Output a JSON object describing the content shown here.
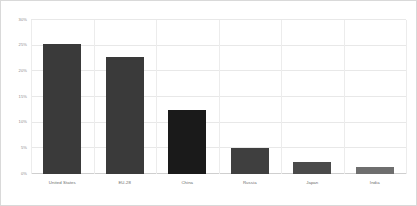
{
  "chart_data": {
    "type": "bar",
    "title": "",
    "subtitle": "",
    "xlabel": "",
    "ylabel": "",
    "categories": [
      "United States",
      "EU-28",
      "China",
      "Russia",
      "Japan",
      "India"
    ],
    "values": [
      25.4,
      22.7,
      12.5,
      5.0,
      2.3,
      1.4
    ],
    "value_suffix": "%",
    "ylim": [
      0,
      30
    ],
    "yticks": [
      0,
      5,
      10,
      15,
      20,
      25,
      30
    ],
    "ytick_labels": [
      "0%",
      "5%",
      "10%",
      "15%",
      "20%",
      "25%",
      "30%"
    ],
    "grid": {
      "horizontal": true,
      "vertical": true
    },
    "legend": {
      "visible": false,
      "position": "none",
      "entries": []
    },
    "bar_colors": [
      "#3a3a3a",
      "#3a3a3a",
      "#1a1a1a",
      "#3f3f3f",
      "#4a4a4a",
      "#6e6e6e"
    ],
    "annotations": []
  },
  "style": {
    "background_color": "#ffffff",
    "border_color": "#d9d9d9",
    "gridline_color": "#e8e8e8",
    "axis_color": "#cfcfcf",
    "tick_label_color": "#8a8a8a",
    "category_label_color": "#6b6b6b"
  }
}
